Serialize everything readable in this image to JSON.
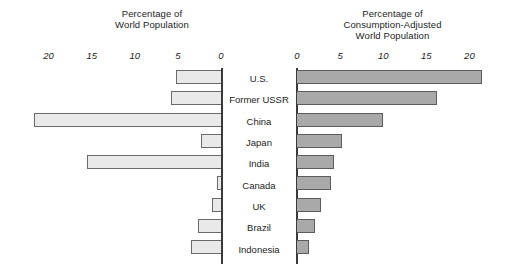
{
  "chart_data": {
    "type": "bar",
    "title": "",
    "orientation": "horizontal",
    "layout": "back-to-back paired horizontal bars with centered category labels",
    "categories": [
      "U.S.",
      "Former USSR",
      "China",
      "Japan",
      "India",
      "Canada",
      "UK",
      "Brazil",
      "Indonesia"
    ],
    "series": [
      {
        "name": "Percentage of World Population",
        "direction": "left",
        "axis_label": "Percentage of\nWorld Population",
        "ticks": [
          20,
          15,
          10,
          5,
          0
        ],
        "axis_range": [
          0,
          23
        ],
        "color": "#e9e9e9",
        "border_color": "#6a6a6a",
        "values": [
          5.2,
          5.8,
          21.7,
          2.3,
          15.5,
          0.5,
          1.0,
          2.7,
          3.5
        ]
      },
      {
        "name": "Percentage of Consumption-Adjusted World Population",
        "direction": "right",
        "axis_label": "Percentage of\nConsumption-Adjusted\nWorld Population",
        "ticks": [
          0,
          5,
          10,
          15,
          20
        ],
        "axis_range": [
          0,
          23
        ],
        "color": "#a9a9a9",
        "border_color": "#5c5c5c",
        "values": [
          21.5,
          16.2,
          10.0,
          5.2,
          4.3,
          4.0,
          2.8,
          2.1,
          1.4
        ]
      }
    ],
    "grid": false,
    "legend": "none",
    "background": "#ffffff"
  },
  "left_panel": {
    "title": "Percentage of\nWorld Population",
    "ticks": [
      "20",
      "15",
      "10",
      "5",
      "0"
    ]
  },
  "right_panel": {
    "title": "Percentage of\nConsumption-Adjusted\nWorld Population",
    "ticks": [
      "0",
      "5",
      "10",
      "15",
      "20"
    ]
  }
}
